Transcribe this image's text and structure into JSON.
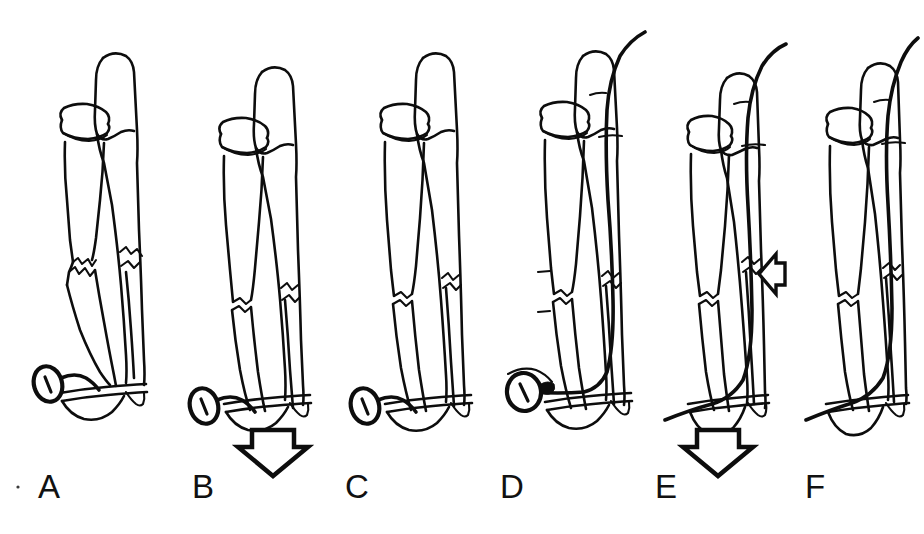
{
  "figure": {
    "panel_count": 6,
    "background_color": "#ffffff",
    "ink_color": "#0d0d0d",
    "canvas": {
      "width": 924,
      "height": 534
    }
  },
  "panels": [
    {
      "id": "A",
      "label": "A",
      "label_x": 38,
      "label_y": 470,
      "caption": "Displaced mid-shaft fracture of both forearm bones with traction screw applied distally",
      "has_wire": false,
      "has_screw": true,
      "screw_style": "oblique-slotted",
      "fracture_state": "displaced-jagged",
      "arrows": []
    },
    {
      "id": "B",
      "label": "B",
      "label_x": 192,
      "label_y": 470,
      "caption": "Longitudinal traction applied through the screw, realigning the fracture fragments",
      "has_wire": false,
      "has_screw": true,
      "screw_style": "oblique-slotted",
      "fracture_state": "partially-reduced",
      "arrows": [
        {
          "name": "traction-arrow-down",
          "direction": "down",
          "style": "hollow",
          "x": 273,
          "y": 450
        }
      ]
    },
    {
      "id": "C",
      "label": "C",
      "label_x": 345,
      "label_y": 470,
      "caption": "Fracture reduced and bones restored to anatomic length and alignment",
      "has_wire": false,
      "has_screw": true,
      "screw_style": "oblique-slotted",
      "fracture_state": "reduced",
      "arrows": []
    },
    {
      "id": "D",
      "label": "D",
      "label_x": 500,
      "label_y": 470,
      "caption": "Intramedullary wire driven antegrade across the fracture site while traction is maintained",
      "has_wire": true,
      "has_screw": true,
      "screw_style": "face-on-slotted",
      "fracture_state": "reduced",
      "arrows": []
    },
    {
      "id": "E",
      "label": "E",
      "label_x": 655,
      "label_y": 470,
      "caption": "Compression applied at the fracture site as the wire is advanced; traction device removed",
      "has_wire": true,
      "has_screw": false,
      "fracture_state": "compressed",
      "arrows": [
        {
          "name": "compression-arrow-left",
          "direction": "left",
          "style": "hollow",
          "x": 762,
          "y": 270
        },
        {
          "name": "traction-arrow-down",
          "direction": "down",
          "style": "hollow",
          "x": 718,
          "y": 450
        }
      ]
    },
    {
      "id": "F",
      "label": "F",
      "label_x": 805,
      "label_y": 470,
      "caption": "Final construct with wire in place and fracture healed in anatomic alignment",
      "has_wire": true,
      "has_screw": false,
      "fracture_state": "healed",
      "arrows": []
    }
  ],
  "anatomy": {
    "bones": [
      "radius",
      "ulna"
    ],
    "landmarks": [
      "radial head",
      "olecranon",
      "distal radius",
      "ulnar styloid"
    ]
  },
  "hardware": {
    "traction_screw": "slotted screw head shown as an oval with a central slot",
    "intramedullary_wire": "smooth curved wire entering proximally and exiting the proximal ulna"
  }
}
